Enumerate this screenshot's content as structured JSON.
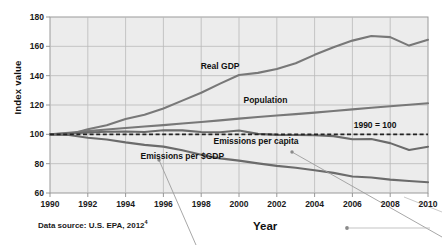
{
  "figure": {
    "bleed_text": "of  a  by  the  p  f  p  r",
    "source_note": "Data source: U.S. EPA, 2012",
    "source_superscript": "4"
  },
  "chart_data": {
    "type": "line",
    "title": "",
    "xlabel": "Year",
    "ylabel": "Index value",
    "xlim": [
      1990,
      2010
    ],
    "ylim": [
      60,
      180
    ],
    "grid": true,
    "legend_position": "inline-labels",
    "xticks": [
      "1990",
      "1992",
      "1994",
      "1996",
      "1998",
      "2000",
      "2002",
      "2004",
      "2006",
      "2008",
      "2010"
    ],
    "yticks": [
      "60",
      "80",
      "100",
      "120",
      "140",
      "160",
      "180"
    ],
    "x": [
      1990,
      1991,
      1992,
      1993,
      1994,
      1995,
      1996,
      1997,
      1998,
      1999,
      2000,
      2001,
      2002,
      2003,
      2004,
      2005,
      2006,
      2007,
      2008,
      2009,
      2010
    ],
    "series": [
      {
        "name": "Real GDP",
        "color": "#787878",
        "values": [
          100,
          99.9,
          103.4,
          106.2,
          110.5,
          113.3,
          117.6,
          123.0,
          128.4,
          134.6,
          140.5,
          141.9,
          144.5,
          148.5,
          154.2,
          159.4,
          163.9,
          167.0,
          166.3,
          160.5,
          164.5
        ]
      },
      {
        "name": "Population",
        "color": "#787878",
        "values": [
          100,
          101.1,
          102.2,
          103.3,
          104.3,
          105.3,
          106.3,
          107.4,
          108.4,
          109.5,
          110.7,
          111.8,
          112.8,
          113.8,
          114.8,
          115.9,
          117.0,
          118.1,
          119.2,
          120.2,
          121.2
        ]
      },
      {
        "name": "Emissions per capita",
        "color": "#6b6b6b",
        "values": [
          100,
          100.6,
          101.2,
          101.8,
          101.9,
          101.6,
          102.8,
          102.7,
          101.6,
          101.4,
          102.6,
          100.3,
          99.6,
          99.5,
          99.4,
          98.8,
          96.6,
          96.8,
          94.0,
          89.3,
          91.5
        ]
      },
      {
        "name": "Emissions per $GDP",
        "color": "#6b6b6b",
        "values": [
          100,
          99.6,
          97.7,
          96.5,
          94.5,
          92.8,
          91.6,
          89.1,
          86.1,
          83.6,
          82.1,
          80.2,
          78.5,
          77.2,
          75.5,
          73.7,
          71.3,
          70.6,
          69.1,
          68.2,
          67.3
        ]
      }
    ],
    "reference_line": {
      "label": "1990 = 100",
      "value": 100,
      "style": "dashed",
      "color": "#222222"
    },
    "annotations": [
      {
        "text": "Real GDP",
        "x": 1999.0,
        "y": 146
      },
      {
        "text": "Population",
        "x": 2001.4,
        "y": 123
      },
      {
        "text": "1990 = 100",
        "x": 2007.2,
        "y": 105.5
      },
      {
        "text": "Emissions per capita",
        "x": 2000.9,
        "y": 94.5
      },
      {
        "text": "Emissions per $GDP",
        "x": 1997.0,
        "y": 84.5
      }
    ]
  }
}
